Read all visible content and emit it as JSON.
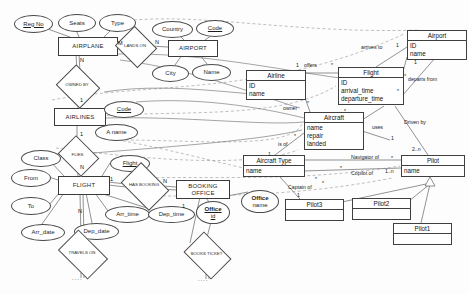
{
  "diagram": {
    "entities": [
      {
        "id": "airplane",
        "label": "AIRPLANE",
        "x": 58,
        "y": 37,
        "w": 58,
        "h": 17
      },
      {
        "id": "airport",
        "label": "AIRPORT",
        "x": 168,
        "y": 40,
        "w": 48,
        "h": 15
      },
      {
        "id": "airlines",
        "label": "AIRLINES",
        "x": 54,
        "y": 108,
        "w": 50,
        "h": 16
      },
      {
        "id": "flight",
        "label": "FLIGHT",
        "x": 58,
        "y": 176,
        "w": 50,
        "h": 17
      },
      {
        "id": "booking_office",
        "label": "BOOKING OFFICE",
        "x": 176,
        "y": 180,
        "w": 52,
        "h": 17
      }
    ],
    "attributes": [
      {
        "id": "reg_no",
        "label": "Reg No",
        "key": true,
        "x": 14,
        "y": 15,
        "w": 37,
        "h": 16
      },
      {
        "id": "seats",
        "label": "Seats",
        "key": false,
        "x": 58,
        "y": 14,
        "w": 36,
        "h": 16
      },
      {
        "id": "type",
        "label": "Type",
        "key": false,
        "x": 99,
        "y": 14,
        "w": 35,
        "h": 16
      },
      {
        "id": "country",
        "label": "Country",
        "key": false,
        "x": 152,
        "y": 21,
        "w": 39,
        "h": 15
      },
      {
        "id": "code_airport",
        "label": "Code",
        "key": true,
        "x": 196,
        "y": 20,
        "w": 36,
        "h": 15
      },
      {
        "id": "city",
        "label": "City",
        "key": false,
        "x": 152,
        "y": 65,
        "w": 35,
        "h": 15
      },
      {
        "id": "name_airport",
        "label": "Name",
        "key": false,
        "x": 192,
        "y": 64,
        "w": 37,
        "h": 15
      },
      {
        "id": "code_airlines",
        "label": "Code",
        "key": true,
        "x": 104,
        "y": 101,
        "w": 38,
        "h": 15
      },
      {
        "id": "a_name",
        "label": "A name",
        "key": false,
        "x": 95,
        "y": 124,
        "w": 41,
        "h": 15
      },
      {
        "id": "class",
        "label": "Class",
        "key": false,
        "x": 21,
        "y": 150,
        "w": 38,
        "h": 15
      },
      {
        "id": "flight_key",
        "label": "Flight",
        "key": true,
        "x": 110,
        "y": 155,
        "w": 38,
        "h": 15
      },
      {
        "id": "from",
        "label": "From",
        "key": false,
        "x": 11,
        "y": 169,
        "w": 38,
        "h": 16
      },
      {
        "id": "to",
        "label": "To",
        "key": false,
        "x": 11,
        "y": 197,
        "w": 38,
        "h": 16
      },
      {
        "id": "arr_time",
        "label": "Arr_time",
        "key": false,
        "x": 105,
        "y": 206,
        "w": 43,
        "h": 15
      },
      {
        "id": "dep_time",
        "label": "Dep_time",
        "key": false,
        "x": 148,
        "y": 206,
        "w": 45,
        "h": 15
      },
      {
        "id": "arr_date",
        "label": "Arr_date",
        "key": false,
        "x": 21,
        "y": 224,
        "w": 42,
        "h": 15
      },
      {
        "id": "dep_date",
        "label": "Dep_date",
        "key": false,
        "x": 74,
        "y": 223,
        "w": 43,
        "h": 15
      },
      {
        "id": "office_id",
        "label": "Office",
        "label2": "id",
        "key": true,
        "x": 196,
        "y": 201,
        "w": 32,
        "h": 21
      },
      {
        "id": "office_name",
        "label": "Office",
        "label2": "name",
        "key": false,
        "x": 241,
        "y": 190,
        "w": 36,
        "h": 21
      }
    ],
    "relationships": [
      {
        "id": "lands_on",
        "label": "LANDS ON",
        "x": 120,
        "y": 33,
        "w": 30,
        "h": 26
      },
      {
        "id": "owned_by",
        "label": "OWNED BY",
        "x": 61,
        "y": 72,
        "w": 32,
        "h": 27
      },
      {
        "id": "flies",
        "label": "FLIES",
        "x": 62,
        "y": 143,
        "w": 31,
        "h": 24
      },
      {
        "id": "has_booking",
        "label": "HAS BOOKING",
        "x": 125,
        "y": 172,
        "w": 38,
        "h": 27
      },
      {
        "id": "travels_on",
        "label": "TRAVELS ON",
        "x": 62,
        "y": 240,
        "w": 40,
        "h": 27
      },
      {
        "id": "books_ticket",
        "label": "BOOKS TICKET",
        "x": 188,
        "y": 241,
        "w": 37,
        "h": 27
      }
    ],
    "cardinalities": [
      {
        "id": "card-airplane-m",
        "text": "M",
        "x": 118,
        "y": 40
      },
      {
        "id": "card-airport-n",
        "text": "N",
        "x": 155,
        "y": 39
      },
      {
        "id": "card-airplane-n",
        "text": "N",
        "x": 80,
        "y": 57
      },
      {
        "id": "card-airlines-1",
        "text": "1",
        "x": 80,
        "y": 97
      },
      {
        "id": "card-airlines-flies-1",
        "text": "1",
        "x": 80,
        "y": 131
      },
      {
        "id": "card-flight-n",
        "text": "N",
        "x": 80,
        "y": 164
      },
      {
        "id": "card-flight-1",
        "text": "1",
        "x": 110,
        "y": 176
      },
      {
        "id": "card-booking-n",
        "text": "N",
        "x": 163,
        "y": 178
      },
      {
        "id": "card-flight-travels-n",
        "text": "N",
        "x": 78,
        "y": 208
      },
      {
        "id": "card-office-1",
        "text": "1",
        "x": 182,
        "y": 203
      }
    ],
    "uml_classes": [
      {
        "id": "uml_airline",
        "name": "Airline",
        "attrs": [
          "ID",
          "name"
        ],
        "x": 246,
        "y": 70,
        "w": 58,
        "h": 30
      },
      {
        "id": "uml_flight",
        "name": "Flight",
        "attrs": [
          "ID",
          "arrival_time",
          "departure_time"
        ],
        "x": 338,
        "y": 67,
        "w": 64,
        "h": 39
      },
      {
        "id": "uml_airport",
        "name": "Airport",
        "attrs": [
          "ID",
          "name"
        ],
        "x": 407,
        "y": 30,
        "w": 58,
        "h": 27
      },
      {
        "id": "uml_aircraft",
        "name": "Aircraft",
        "attrs": [
          "name",
          "repair",
          "landed"
        ],
        "x": 304,
        "y": 112,
        "w": 58,
        "h": 37
      },
      {
        "id": "uml_aircraft_type",
        "name": "Aircraft Type",
        "attrs": [
          "name"
        ],
        "x": 243,
        "y": 155,
        "w": 60,
        "h": 22
      },
      {
        "id": "uml_pilot",
        "name": "Pilot",
        "attrs": [
          "name"
        ],
        "x": 401,
        "y": 155,
        "w": 62,
        "h": 22
      },
      {
        "id": "uml_pilot3",
        "name": "Pilot3",
        "attrs": [],
        "x": 285,
        "y": 199,
        "w": 57,
        "h": 22
      },
      {
        "id": "uml_pilot2",
        "name": "Pilot2",
        "attrs": [],
        "x": 352,
        "y": 198,
        "w": 57,
        "h": 22
      },
      {
        "id": "uml_pilot1",
        "name": "Pilot1",
        "attrs": [],
        "x": 393,
        "y": 223,
        "w": 57,
        "h": 22
      }
    ],
    "uml_labels": [
      {
        "id": "lbl_arrives_to",
        "text": "arrives to",
        "x": 361,
        "y": 44
      },
      {
        "id": "lbl_departs_from",
        "text": "departs from",
        "x": 408,
        "y": 76
      },
      {
        "id": "lbl_offers",
        "text": "offers",
        "x": 304,
        "y": 62
      },
      {
        "id": "lbl_owner",
        "text": "owner",
        "x": 283,
        "y": 105
      },
      {
        "id": "lbl_is_of",
        "text": "is of",
        "x": 278,
        "y": 141
      },
      {
        "id": "lbl_uses",
        "text": "uses",
        "x": 372,
        "y": 124
      },
      {
        "id": "lbl_driven_by",
        "text": "Driven by",
        "x": 404,
        "y": 119
      },
      {
        "id": "lbl_navigator_of",
        "text": "Navigator of",
        "x": 351,
        "y": 154
      },
      {
        "id": "lbl_copilot_of",
        "text": "Copilot of",
        "x": 351,
        "y": 170
      },
      {
        "id": "lbl_captain_of",
        "text": "Captain of",
        "x": 288,
        "y": 184
      }
    ],
    "uml_multiplicities": [
      {
        "id": "m_airport_1a",
        "text": "1",
        "x": 396,
        "y": 42
      },
      {
        "id": "m_airport_1b",
        "text": "1",
        "x": 414,
        "y": 59
      },
      {
        "id": "m_flight_star_a",
        "text": "*",
        "x": 404,
        "y": 73
      },
      {
        "id": "m_flight_star_b",
        "text": "*",
        "x": 397,
        "y": 88
      },
      {
        "id": "m_offers_1",
        "text": "1",
        "x": 296,
        "y": 62
      },
      {
        "id": "m_offers_star",
        "text": "*",
        "x": 331,
        "y": 62
      },
      {
        "id": "m_airline_star",
        "text": "*",
        "x": 307,
        "y": 100
      },
      {
        "id": "m_aircraft_star",
        "text": "*",
        "x": 344,
        "y": 108
      },
      {
        "id": "m_uses_1",
        "text": "1",
        "x": 391,
        "y": 135
      },
      {
        "id": "m_isof_star",
        "text": "*",
        "x": 294,
        "y": 133
      },
      {
        "id": "m_isof_1",
        "text": "1",
        "x": 268,
        "y": 151
      },
      {
        "id": "m_pilot_2n",
        "text": "2..n",
        "x": 412,
        "y": 146
      },
      {
        "id": "m_pilot_star",
        "text": "*",
        "x": 391,
        "y": 155
      },
      {
        "id": "m_type_star",
        "text": "*",
        "x": 340,
        "y": 165
      },
      {
        "id": "m_copilot_1n",
        "text": "1..n",
        "x": 385,
        "y": 168
      },
      {
        "id": "m_captain_star",
        "text": "*",
        "x": 322,
        "y": 180
      },
      {
        "id": "m_captain_1",
        "text": "1",
        "x": 297,
        "y": 192
      },
      {
        "id": "m_aircrafttype_star",
        "text": "*",
        "x": 315,
        "y": 176
      }
    ],
    "ellipsis_markers": [
      {
        "id": "dots-travels",
        "text": "....",
        "x": 72,
        "y": 275
      },
      {
        "id": "dots-books",
        "text": "....",
        "x": 198,
        "y": 276
      }
    ]
  }
}
